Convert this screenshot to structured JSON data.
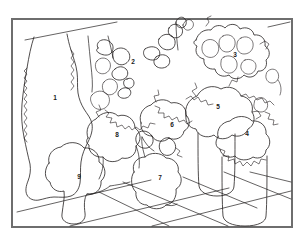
{
  "figure": {
    "kind": "line-drawing-segmentation",
    "background_color": "#ffffff",
    "ink_color": "#231f20",
    "frame": {
      "name": "image-frame",
      "color": "#6e6e6e",
      "x": 11,
      "y": 18,
      "width": 282,
      "height": 210,
      "stroke_width": 2
    },
    "scene": {
      "ceiling_line_left": "diagonal line from upper-left wall to ceiling",
      "ceiling_line_right": "short diagonal line at upper-right",
      "floor": "tiled floor with diagonal tile seams at lower right"
    },
    "regions": [
      {
        "id": 1,
        "label": "1",
        "x": 55,
        "y": 98,
        "description": "tall pale leaf at far left"
      },
      {
        "id": 2,
        "label": "2",
        "x": 133,
        "y": 62,
        "description": "scattered small leaves upper middle"
      },
      {
        "id": 3,
        "label": "3",
        "x": 235,
        "y": 55,
        "description": "bushy foliage upper right"
      },
      {
        "id": 4,
        "label": "4",
        "x": 247,
        "y": 134,
        "description": "plant crown on right cylindrical pot"
      },
      {
        "id": 5,
        "label": "5",
        "x": 218,
        "y": 107,
        "description": "rounded foliage mass right of center"
      },
      {
        "id": 6,
        "label": "6",
        "x": 172,
        "y": 125,
        "description": "foliage mass center"
      },
      {
        "id": 7,
        "label": "7",
        "x": 160,
        "y": 178,
        "description": "front center pot"
      },
      {
        "id": 8,
        "label": "8",
        "x": 117,
        "y": 135,
        "description": "broad leaf cluster left of center"
      },
      {
        "id": 9,
        "label": "9",
        "x": 79,
        "y": 177,
        "description": "large front-left pot"
      }
    ]
  }
}
